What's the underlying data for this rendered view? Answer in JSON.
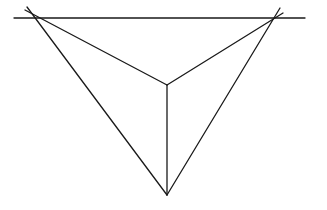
{
  "diagram": {
    "type": "two-point-perspective",
    "stroke_color": "#1a1a1a",
    "background_color": "#ffffff",
    "horizon": {
      "x1": 14,
      "y1": 18,
      "x2": 305,
      "y2": 18
    },
    "vanishing_points": {
      "left": {
        "x": 34,
        "y": 18
      },
      "right": {
        "x": 275,
        "y": 18
      }
    },
    "vertical_edge": {
      "top": {
        "x": 167,
        "y": 85
      },
      "bottom": {
        "x": 167,
        "y": 195
      }
    },
    "lines": [
      {
        "name": "horizon-line",
        "x1": 14,
        "y1": 18,
        "x2": 305,
        "y2": 18
      },
      {
        "name": "left-vp-to-top-line",
        "x1": 25,
        "y1": 10,
        "x2": 167,
        "y2": 85
      },
      {
        "name": "left-vp-to-bottom-line",
        "x1": 27,
        "y1": 7,
        "x2": 167,
        "y2": 195
      },
      {
        "name": "right-vp-to-top-line",
        "x1": 283,
        "y1": 13,
        "x2": 167,
        "y2": 85
      },
      {
        "name": "right-vp-to-bottom-line",
        "x1": 280,
        "y1": 8,
        "x2": 167,
        "y2": 195
      },
      {
        "name": "vertical-edge-line",
        "x1": 167,
        "y1": 85,
        "x2": 167,
        "y2": 195
      }
    ]
  }
}
